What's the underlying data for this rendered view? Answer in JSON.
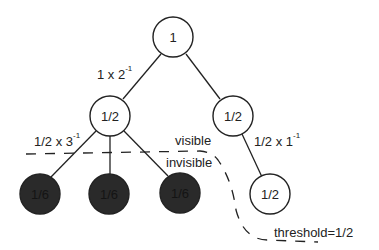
{
  "diagram": {
    "nodes": {
      "root": {
        "label": "1",
        "shaded": false
      },
      "left_mid": {
        "label": "1/2",
        "shaded": false
      },
      "right_mid": {
        "label": "1/2",
        "shaded": false
      },
      "leaf_1": {
        "label": "1/6",
        "shaded": true
      },
      "leaf_2": {
        "label": "1/6",
        "shaded": true
      },
      "leaf_3": {
        "label": "1/6",
        "shaded": true
      },
      "right_leaf": {
        "label": "1/2",
        "shaded": false
      }
    },
    "edge_labels": {
      "root_to_children": {
        "base": "1 x 2",
        "exp": "-1"
      },
      "left_mid_to_leaves": {
        "base": "1/2 x 3",
        "exp": "-1"
      },
      "right_mid_to_leaf": {
        "base": "1/2 x 1",
        "exp": "-1"
      }
    },
    "boundary": {
      "visible_label": "visible",
      "invisible_label": "invisible",
      "threshold_label": "threshold=1/2"
    },
    "colors": {
      "stroke": "#222222",
      "shaded_fill": "#2a2a2a",
      "background": "#ffffff"
    }
  }
}
